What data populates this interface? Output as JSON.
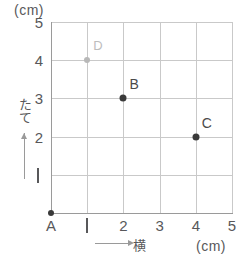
{
  "figure": {
    "type": "coordinate-grid",
    "unit_top_label": "(cm)",
    "unit_bottom_label": "(cm)",
    "y_axis_name": "たて",
    "x_axis_name": "横",
    "grid": {
      "x_min": 0,
      "x_max": 5,
      "y_min": 0,
      "y_max": 5,
      "step": 1,
      "grid_visible": true
    },
    "y_ticks": [
      {
        "value": 5,
        "label": "5",
        "style": "digit"
      },
      {
        "value": 4,
        "label": "4",
        "style": "digit"
      },
      {
        "value": 3,
        "label": "3",
        "style": "digit"
      },
      {
        "value": 2,
        "label": "2",
        "style": "digit"
      },
      {
        "value": 1,
        "label": "1",
        "style": "bar"
      }
    ],
    "x_ticks": [
      {
        "value": 0,
        "label": "A",
        "style": "point-name"
      },
      {
        "value": 1,
        "label": "1",
        "style": "bar"
      },
      {
        "value": 2,
        "label": "2",
        "style": "digit"
      },
      {
        "value": 3,
        "label": "3",
        "style": "digit"
      },
      {
        "value": 4,
        "label": "4",
        "style": "digit"
      },
      {
        "value": 5,
        "label": "5",
        "style": "digit"
      }
    ],
    "points": [
      {
        "name": "A",
        "x": 0,
        "y": 0,
        "color": "#3a3a3a",
        "label_color": "#58585a",
        "label_position": "below",
        "radius": 3,
        "faded": false
      },
      {
        "name": "B",
        "x": 2,
        "y": 3,
        "color": "#3a3a3a",
        "label_color": "#4a4a4a",
        "label_position": "above-right",
        "radius": 3.5,
        "faded": false
      },
      {
        "name": "C",
        "x": 4,
        "y": 2,
        "color": "#3a3a3a",
        "label_color": "#4a4a4a",
        "label_position": "above-right",
        "radius": 3.5,
        "faded": false
      },
      {
        "name": "D",
        "x": 1,
        "y": 4,
        "color": "#b8b8b8",
        "label_color": "#bdbdbd",
        "label_position": "above-right",
        "radius": 3,
        "faded": true
      }
    ]
  },
  "chart_data": {
    "type": "scatter",
    "title": "",
    "xlabel": "横 (cm)",
    "ylabel": "たて (cm)",
    "xlim": [
      0,
      5
    ],
    "ylim": [
      0,
      5
    ],
    "xticks": [
      "A",
      "1",
      "2",
      "3",
      "4",
      "5"
    ],
    "yticks": [
      "1",
      "2",
      "3",
      "4",
      "5"
    ],
    "grid": true,
    "legend": "none",
    "series": [
      {
        "name": "points",
        "points": [
          {
            "label": "A",
            "x": 0,
            "y": 0
          },
          {
            "label": "B",
            "x": 2,
            "y": 3
          },
          {
            "label": "C",
            "x": 4,
            "y": 2
          },
          {
            "label": "D",
            "x": 1,
            "y": 4
          }
        ]
      }
    ],
    "annotations": [
      "(cm)",
      "(cm)",
      "たて",
      "横"
    ]
  }
}
